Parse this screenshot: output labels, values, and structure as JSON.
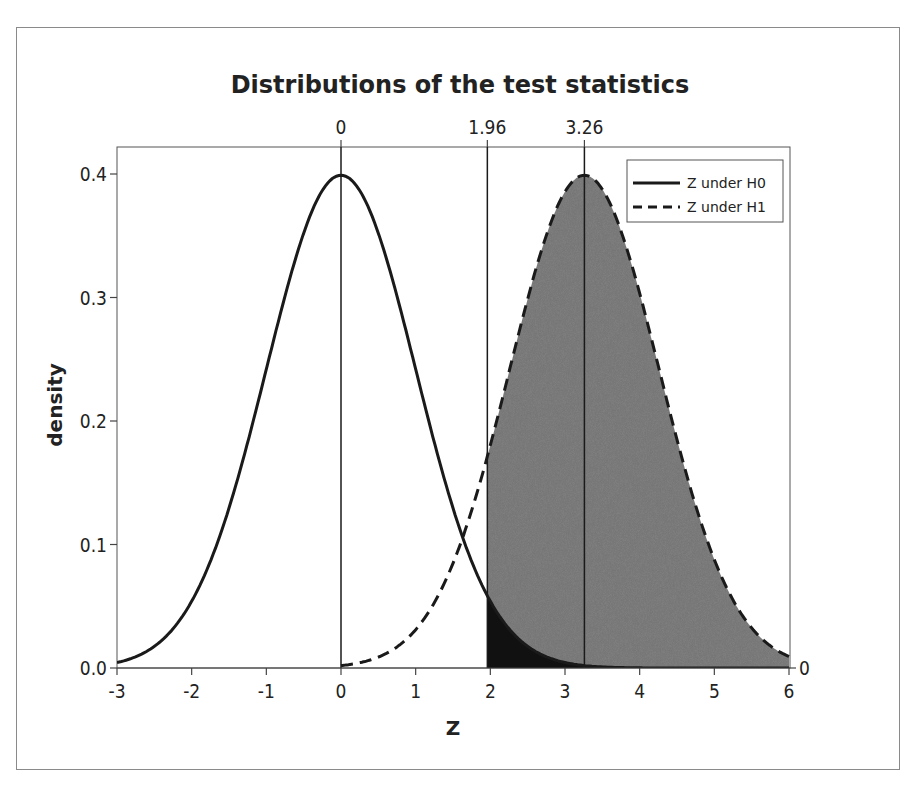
{
  "chart_data": {
    "type": "line",
    "title": "Distributions of the test statistics",
    "xlabel": "Z",
    "ylabel": "density",
    "xlim": [
      -3,
      6
    ],
    "ylim": [
      0,
      0.42
    ],
    "x_ticks": [
      -3,
      -2,
      -1,
      0,
      1,
      2,
      3,
      4,
      5,
      6
    ],
    "x_tick_labels": [
      "-3",
      "-2",
      "-1",
      "0",
      "1",
      "2",
      "3",
      "4",
      "5",
      "6"
    ],
    "y_ticks": [
      0.0,
      0.1,
      0.2,
      0.3,
      0.4
    ],
    "y_tick_labels": [
      "0.0",
      "0.1",
      "0.2",
      "0.3",
      "0.4"
    ],
    "top_axis_labels": [
      {
        "x": 0,
        "label": "0"
      },
      {
        "x": 1.96,
        "label": "1.96"
      },
      {
        "x": 3.26,
        "label": "3.26"
      }
    ],
    "right_axis_labels": [
      {
        "y": 0,
        "label": "0"
      }
    ],
    "vertical_lines": [
      0,
      1.96,
      3.26
    ],
    "grid": false,
    "legend_position": "upper right",
    "series": [
      {
        "name": "Z under H0",
        "style": "solid",
        "distribution": "normal",
        "mean": 0,
        "sd": 1,
        "x": [
          -3,
          -2.5,
          -2,
          -1.5,
          -1,
          -0.5,
          0,
          0.5,
          1,
          1.5,
          1.96,
          2.5,
          3,
          3.5,
          4,
          4.5,
          5,
          5.5,
          6
        ],
        "values": [
          0.0044,
          0.0175,
          0.054,
          0.1295,
          0.242,
          0.3521,
          0.3989,
          0.3521,
          0.242,
          0.1295,
          0.0584,
          0.0175,
          0.0044,
          0.0009,
          0.0001,
          0.0,
          0.0,
          0.0,
          0.0
        ]
      },
      {
        "name": "Z under H1",
        "style": "dashed",
        "distribution": "normal",
        "mean": 3.26,
        "sd": 1,
        "x": [
          0,
          0.5,
          1,
          1.5,
          1.96,
          2.5,
          3,
          3.26,
          3.5,
          4,
          4.5,
          5,
          5.5,
          6
        ],
        "values": [
          0.002,
          0.0089,
          0.0311,
          0.0846,
          0.1714,
          0.2989,
          0.3856,
          0.3989,
          0.3876,
          0.3034,
          0.1849,
          0.0878,
          0.0325,
          0.0093
        ]
      }
    ],
    "shaded_regions": [
      {
        "name": "power",
        "under": "Z under H1",
        "from": 1.96,
        "to": 6,
        "color": "#858585"
      },
      {
        "name": "alpha",
        "under": "Z under H0",
        "from": 1.96,
        "to": 6,
        "color": "#111111"
      }
    ]
  },
  "legend": {
    "items": [
      {
        "label": "Z under H0",
        "style": "solid"
      },
      {
        "label": "Z under H1",
        "style": "dashed"
      }
    ]
  },
  "colors": {
    "line": "#1a1a1a",
    "power_fill": "#858585",
    "alpha_fill": "#111111",
    "frame": "#8a8a8a"
  }
}
